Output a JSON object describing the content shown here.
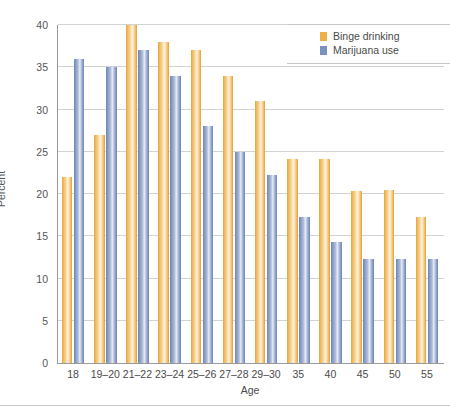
{
  "chart_data": {
    "type": "bar",
    "title": "",
    "xlabel": "Age",
    "ylabel": "Percent",
    "ylim": [
      0,
      40
    ],
    "yticks": [
      0,
      5,
      10,
      15,
      20,
      25,
      30,
      35,
      40
    ],
    "grid": true,
    "legend_position": "top-right",
    "categories": [
      "18",
      "19–20",
      "21–22",
      "23–24",
      "25–26",
      "27–28",
      "29–30",
      "35",
      "40",
      "45",
      "50",
      "55"
    ],
    "series": [
      {
        "name": "Binge drinking",
        "color": "#eeae49",
        "values": [
          22,
          27,
          40,
          38,
          37,
          34,
          31,
          24.2,
          24.2,
          20.4,
          20.5,
          17.3
        ]
      },
      {
        "name": "Marijuana use",
        "color": "#7b92bf",
        "values": [
          36,
          35,
          37,
          34,
          28,
          25,
          22.2,
          17.3,
          14.3,
          12.3,
          12.3,
          12.3
        ]
      }
    ]
  }
}
